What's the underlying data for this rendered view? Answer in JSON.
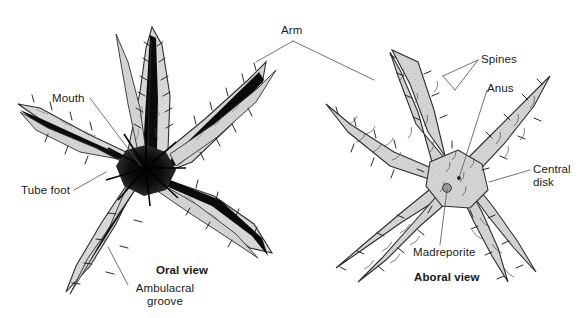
{
  "figure": {
    "background_color": "#ffffff",
    "width": 588,
    "height": 318,
    "line_color": "#3c3c3c",
    "text_color": "#1a1a1a"
  },
  "labels": {
    "arm": "Arm",
    "mouth": "Mouth",
    "tube_foot": "Tube foot",
    "ambulacral_line1": "Ambulacral",
    "ambulacral_line2": "groove",
    "oral_view": "Oral view",
    "spines": "Spines",
    "anus": "Anus",
    "central_line1": "Central",
    "central_line2": "disk",
    "madreporite": "Madreporite",
    "aboral_view": "Aboral view"
  },
  "specimens": [
    {
      "name": "oral-view-starfish",
      "view": "Oral view",
      "arm_count": 5,
      "features": [
        "Mouth",
        "Tube foot",
        "Ambulacral groove",
        "Arm"
      ],
      "body_fill": "#d8d8d8",
      "groove_fill": "#0a0a0a"
    },
    {
      "name": "aboral-view-starfish",
      "view": "Aboral view",
      "arm_count": 5,
      "features": [
        "Spines",
        "Anus",
        "Central disk",
        "Madreporite",
        "Arm"
      ],
      "body_fill": "#d2d2d2"
    }
  ]
}
